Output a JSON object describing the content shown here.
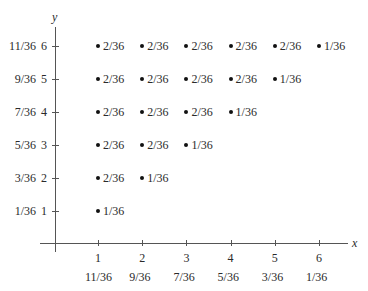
{
  "chart_data": {
    "type": "scatter",
    "title": "",
    "xlabel": "x",
    "ylabel": "y",
    "x_ticks": [
      1,
      2,
      3,
      4,
      5,
      6
    ],
    "y_ticks": [
      1,
      2,
      3,
      4,
      5,
      6
    ],
    "x_marginals": [
      "11/36",
      "9/36",
      "7/36",
      "5/36",
      "3/36",
      "1/36"
    ],
    "y_marginals": [
      "1/36",
      "3/36",
      "5/36",
      "7/36",
      "9/36",
      "11/36"
    ],
    "grid": false,
    "points": [
      {
        "x": 1,
        "y": 1,
        "label": "1/36"
      },
      {
        "x": 1,
        "y": 2,
        "label": "2/36"
      },
      {
        "x": 2,
        "y": 2,
        "label": "1/36"
      },
      {
        "x": 1,
        "y": 3,
        "label": "2/36"
      },
      {
        "x": 2,
        "y": 3,
        "label": "2/36"
      },
      {
        "x": 3,
        "y": 3,
        "label": "1/36"
      },
      {
        "x": 1,
        "y": 4,
        "label": "2/36"
      },
      {
        "x": 2,
        "y": 4,
        "label": "2/36"
      },
      {
        "x": 3,
        "y": 4,
        "label": "2/36"
      },
      {
        "x": 4,
        "y": 4,
        "label": "1/36"
      },
      {
        "x": 1,
        "y": 5,
        "label": "2/36"
      },
      {
        "x": 2,
        "y": 5,
        "label": "2/36"
      },
      {
        "x": 3,
        "y": 5,
        "label": "2/36"
      },
      {
        "x": 4,
        "y": 5,
        "label": "2/36"
      },
      {
        "x": 5,
        "y": 5,
        "label": "1/36"
      },
      {
        "x": 1,
        "y": 6,
        "label": "2/36"
      },
      {
        "x": 2,
        "y": 6,
        "label": "2/36"
      },
      {
        "x": 3,
        "y": 6,
        "label": "2/36"
      },
      {
        "x": 4,
        "y": 6,
        "label": "2/36"
      },
      {
        "x": 5,
        "y": 6,
        "label": "2/36"
      },
      {
        "x": 6,
        "y": 6,
        "label": "1/36"
      }
    ]
  }
}
